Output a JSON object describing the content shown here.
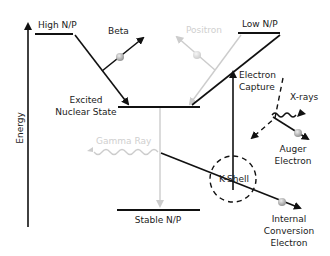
{
  "diagram": {
    "axis": {
      "label": "Energy"
    },
    "levels": {
      "high_np": "High N/P",
      "low_np": "Low N/P",
      "excited_line1": "Excited",
      "excited_line2": "Nuclear State",
      "stable_np": "Stable N/P"
    },
    "processes": {
      "beta": "Beta",
      "positron": "Positron",
      "electron_capture_line1": "Electron",
      "electron_capture_line2": "Capture",
      "xrays": "X-rays",
      "auger_line1": "Auger",
      "auger_line2": "Electron",
      "k_shell": "K-Shell",
      "gamma_ray": "Gamma Ray",
      "ic_line1": "Internal",
      "ic_line2": "Conversion",
      "ic_line3": "Electron"
    },
    "colors": {
      "line": "#111111",
      "faint": "#cccccc",
      "particle": "#b5b5b5"
    }
  }
}
